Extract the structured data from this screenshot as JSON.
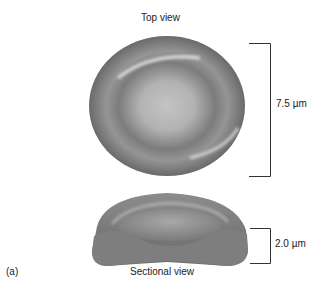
{
  "figure": {
    "panel_label": "(a)",
    "top_view": {
      "title": "Top view",
      "dimension_label": "7.5 µm"
    },
    "sectional_view": {
      "title": "Sectional view",
      "dimension_label": "2.0 µm"
    },
    "colors": {
      "cell_base": "#8a8a8a",
      "cell_dark": "#6e6e6e",
      "cell_light": "#c8c8c8",
      "bracket": "#333333"
    }
  }
}
